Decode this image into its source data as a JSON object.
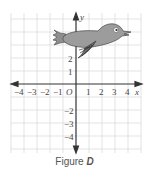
{
  "figure": {
    "caption_prefix": "Figure",
    "caption_letter": "D",
    "x_axis_label": "x",
    "y_axis_label": "y",
    "origin_label": "O",
    "x_ticks": [
      "−4",
      "−3",
      "−2",
      "−1",
      "1",
      "2",
      "3",
      "4"
    ],
    "y_ticks_positive": [
      "2",
      "1"
    ],
    "y_ticks_negative": [
      "−2",
      "−3",
      "−4"
    ],
    "grid_color": "#d8d8d8",
    "axis_color": "#333333",
    "bird_color": "#9a9a9a",
    "bird_outline": "#444444",
    "image": "bird shape drawn in upper half of coordinate grid, facing right"
  }
}
